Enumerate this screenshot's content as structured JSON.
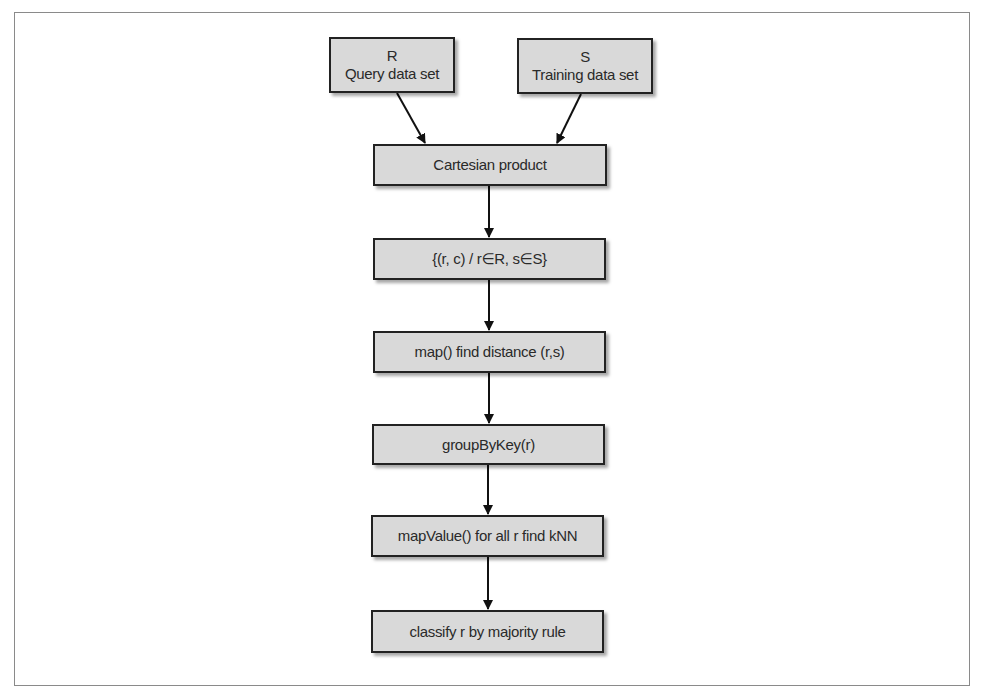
{
  "diagram": {
    "type": "flowchart",
    "direction": "top-to-bottom",
    "colors": {
      "node_fill": "#d9d9d9",
      "node_border": "#222222",
      "text": "#2a2a2a",
      "arrow": "#111111",
      "frame": "#8a8a8a"
    },
    "nodes": {
      "r": {
        "line1": "R",
        "line2": "Query data set"
      },
      "s": {
        "line1": "S",
        "line2": "Training data set"
      },
      "cartesian": {
        "label": "Cartesian product"
      },
      "pairs": {
        "label": "{(r, c) / r∈R, s∈S}"
      },
      "map": {
        "label": "map() find distance (r,s)"
      },
      "group": {
        "label": "groupByKey(r)"
      },
      "mapvalue": {
        "label": "mapValue() for all r find kNN"
      },
      "classify": {
        "label": "classify r by majority rule"
      }
    },
    "edges": [
      {
        "from": "r",
        "to": "cartesian"
      },
      {
        "from": "s",
        "to": "cartesian"
      },
      {
        "from": "cartesian",
        "to": "pairs"
      },
      {
        "from": "pairs",
        "to": "map"
      },
      {
        "from": "map",
        "to": "group"
      },
      {
        "from": "group",
        "to": "mapvalue"
      },
      {
        "from": "mapvalue",
        "to": "classify"
      }
    ]
  }
}
